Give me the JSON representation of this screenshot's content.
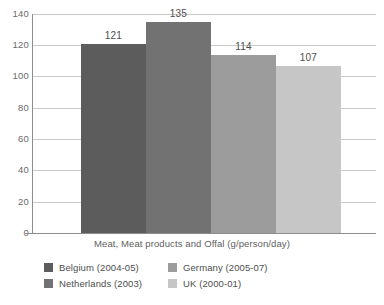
{
  "chart_data": {
    "type": "bar",
    "title": "",
    "subtitle": "",
    "xlabel": "Meat, Meat products and Offal (g/person/day)",
    "ylabel": "",
    "categories": [
      "Belgium (2004-05)",
      "Netherlands (2003)",
      "Germany (2005-07)",
      "UK (2000-01)"
    ],
    "values": [
      121,
      135,
      114,
      107
    ],
    "value_labels": [
      "121",
      "135",
      "114",
      "107"
    ],
    "ylim": [
      0,
      140
    ],
    "ytick_labels": [
      "0",
      "20",
      "40",
      "60",
      "80",
      "100",
      "120",
      "140"
    ],
    "ytick_values": [
      0,
      20,
      40,
      60,
      80,
      100,
      120,
      140
    ],
    "grid": "horizontal",
    "legend_position": "bottom",
    "bar_colors": [
      "#5c5c5c",
      "#727272",
      "#9c9c9c",
      "#c6c6c6"
    ],
    "axis_color": "#8d8d8d",
    "grid_color": "#c9c9c9",
    "background": "#ffffff"
  },
  "axis": {
    "y_ticks": [
      {
        "label": "140",
        "value": 140
      },
      {
        "label": "120",
        "value": 120
      },
      {
        "label": "100",
        "value": 100
      },
      {
        "label": "80",
        "value": 80
      },
      {
        "label": "60",
        "value": 60
      },
      {
        "label": "40",
        "value": 40
      },
      {
        "label": "20",
        "value": 20
      },
      {
        "label": "0",
        "value": 0
      }
    ]
  },
  "caption": {
    "x_axis_title": "Meat, Meat products and Offal (g/person/day)"
  },
  "legend": {
    "items": [
      {
        "label": "Belgium (2004-05)",
        "color": "#5c5c5c"
      },
      {
        "label": "Germany (2005-07)",
        "color": "#9c9c9c"
      },
      {
        "label": "Netherlands (2003)",
        "color": "#727272"
      },
      {
        "label": "UK (2000-01)",
        "color": "#c6c6c6"
      }
    ]
  }
}
